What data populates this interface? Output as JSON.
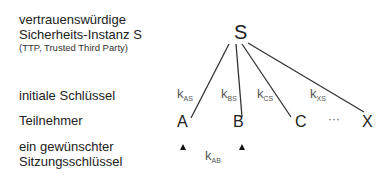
{
  "labels": {
    "ttp_line1": "vertrauenswürdige",
    "ttp_line2": "Sicherheits-Instanz S",
    "ttp_line3": "(TTP, Trusted Third Party)",
    "initial_keys": "initiale Schlüssel",
    "participants": "Teilnehmer",
    "session_key_line1": "ein gewünschter",
    "session_key_line2": "Sitzungsschlüssel"
  },
  "nodes": {
    "server": "S",
    "a": "A",
    "b": "B",
    "c": "C",
    "ellipsis": "···",
    "x": "X"
  },
  "keys": {
    "k_as": {
      "base": "k",
      "sub": "AS"
    },
    "k_bs": {
      "base": "k",
      "sub": "BS"
    },
    "k_cs": {
      "base": "k",
      "sub": "CS"
    },
    "k_xs": {
      "base": "k",
      "sub": "XS"
    },
    "k_ab": {
      "base": "k",
      "sub": "AB"
    }
  },
  "colors": {
    "line": "#333333",
    "text": "#222222",
    "key_text": "#555555"
  }
}
